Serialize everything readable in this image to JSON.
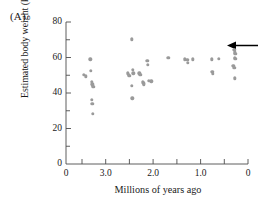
{
  "figure": {
    "panel_label": "(A)"
  },
  "chart_data": {
    "type": "scatter",
    "title": "",
    "xlabel": "Millions of years ago",
    "ylabel": "Estimated body weight (kg)",
    "xlim": [
      3.55,
      -0.18
    ],
    "ylim": [
      0,
      80
    ],
    "x_reversed": true,
    "grid": false,
    "legend": null,
    "x_ticks": [
      3.5,
      3.0,
      2.5,
      2.0,
      1.5,
      1.0,
      0.5,
      0.0
    ],
    "x_tick_labels": [
      "",
      "3.0",
      "",
      "2.0",
      "",
      "1.0",
      "",
      "0"
    ],
    "x_origin_label": "0",
    "y_ticks": [
      0,
      10,
      20,
      30,
      40,
      50,
      60,
      70,
      80
    ],
    "y_tick_labels": [
      "0",
      "",
      "20",
      "",
      "40",
      "",
      "60",
      "",
      "80"
    ],
    "marker": {
      "shape": "circle",
      "color": "#9a9a9a",
      "size_px": 3.4
    },
    "points": [
      {
        "x": 3.18,
        "y": 50.2
      },
      {
        "x": 3.15,
        "y": 49.4
      },
      {
        "x": 3.05,
        "y": 59.0
      },
      {
        "x": 3.04,
        "y": 52.5
      },
      {
        "x": 3.02,
        "y": 46.2
      },
      {
        "x": 3.01,
        "y": 45.0
      },
      {
        "x": 3.0,
        "y": 44.0
      },
      {
        "x": 2.99,
        "y": 43.6
      },
      {
        "x": 3.02,
        "y": 36.2
      },
      {
        "x": 3.01,
        "y": 34.0
      },
      {
        "x": 3.0,
        "y": 28.4
      },
      {
        "x": 2.2,
        "y": 70.2
      },
      {
        "x": 2.18,
        "y": 53.0
      },
      {
        "x": 2.17,
        "y": 51.2
      },
      {
        "x": 2.28,
        "y": 51.0
      },
      {
        "x": 2.26,
        "y": 50.2
      },
      {
        "x": 2.25,
        "y": 49.6
      },
      {
        "x": 2.2,
        "y": 44.2
      },
      {
        "x": 2.19,
        "y": 37.0
      },
      {
        "x": 2.05,
        "y": 51.0
      },
      {
        "x": 2.03,
        "y": 50.4
      },
      {
        "x": 1.98,
        "y": 46.0
      },
      {
        "x": 1.96,
        "y": 45.4
      },
      {
        "x": 1.95,
        "y": 44.8
      },
      {
        "x": 1.88,
        "y": 58.0
      },
      {
        "x": 1.87,
        "y": 56.0
      },
      {
        "x": 1.85,
        "y": 46.8
      },
      {
        "x": 1.8,
        "y": 46.6
      },
      {
        "x": 1.45,
        "y": 60.0
      },
      {
        "x": 1.12,
        "y": 59.0
      },
      {
        "x": 1.06,
        "y": 58.6
      },
      {
        "x": 1.05,
        "y": 57.0
      },
      {
        "x": 0.95,
        "y": 59.0
      },
      {
        "x": 0.56,
        "y": 59.0
      },
      {
        "x": 0.42,
        "y": 59.2
      },
      {
        "x": 0.55,
        "y": 51.8
      },
      {
        "x": 0.54,
        "y": 50.8
      },
      {
        "x": 0.1,
        "y": 64.4
      },
      {
        "x": 0.09,
        "y": 63.0
      },
      {
        "x": 0.08,
        "y": 62.2
      },
      {
        "x": 0.09,
        "y": 60.0
      },
      {
        "x": 0.08,
        "y": 59.2
      },
      {
        "x": 0.12,
        "y": 55.2
      },
      {
        "x": 0.1,
        "y": 54.2
      },
      {
        "x": 0.09,
        "y": 48.2
      }
    ],
    "annotations": [
      {
        "type": "arrow",
        "name": "modern-human-arrow",
        "direction": "left",
        "points_at_x": 0.07,
        "points_at_y": 65.0,
        "color": "#000000"
      }
    ]
  }
}
